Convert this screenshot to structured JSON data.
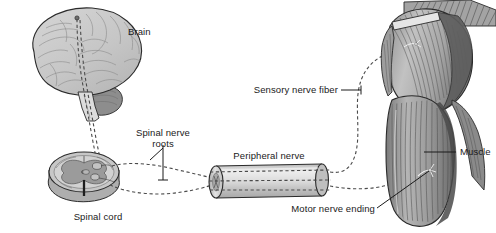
{
  "figure": {
    "background_color": "#ffffff"
  },
  "palette": {
    "outline": "#2b2b2b",
    "brain_fill": "#c9c9c9",
    "brain_fill_light": "#d6d6d6",
    "cerebellum_fill": "#8d8d8d",
    "brainstem_fill": "#dcdcdc",
    "cord_white_matter": "#c4c4c4",
    "cord_gray_matter": "#9a9a9a",
    "cord_side_face": "#b0b0b0",
    "nerve_cylinder_fill": "#d3d3d3",
    "nerve_cylinder_highlight": "#ededed",
    "muscle_light": "#bdbdbd",
    "muscle_mid": "#9e9e9e",
    "muscle_dark": "#5f5f5f",
    "muscle_darkest": "#3c3c3c",
    "dashed_nerve": "#4a4a4a",
    "label_text": "#1a1a1a",
    "leader_line": "#1a1a1a"
  },
  "labels": {
    "brain": "Brain",
    "spinal_nerve_roots_line1": "Spinal nerve",
    "spinal_nerve_roots_line2": "roots",
    "spinal_cord": "Spinal cord",
    "peripheral_nerve": "Peripheral nerve",
    "sensory_nerve_fiber": "Sensory nerve fiber",
    "motor_nerve_ending": "Motor nerve ending",
    "muscle": "Muscle"
  },
  "structures": [
    {
      "id": "brain",
      "name": "Brain",
      "label": "Brain"
    },
    {
      "id": "cerebellum",
      "name": "Cerebellum",
      "label": ""
    },
    {
      "id": "brainstem",
      "name": "Brainstem",
      "label": ""
    },
    {
      "id": "spinal-cord",
      "name": "Spinal cord cross-section",
      "label": "Spinal cord"
    },
    {
      "id": "spinal-nerve-roots",
      "name": "Spinal nerve roots",
      "label": "Spinal nerve roots"
    },
    {
      "id": "peripheral-nerve",
      "name": "Peripheral nerve",
      "label": "Peripheral nerve"
    },
    {
      "id": "sensory-nerve-fiber",
      "name": "Sensory nerve fiber",
      "label": "Sensory nerve fiber"
    },
    {
      "id": "motor-nerve-ending",
      "name": "Motor nerve ending",
      "label": "Motor nerve ending"
    },
    {
      "id": "muscle",
      "name": "Muscle (shoulder and upper arm)",
      "label": "Muscle"
    }
  ]
}
